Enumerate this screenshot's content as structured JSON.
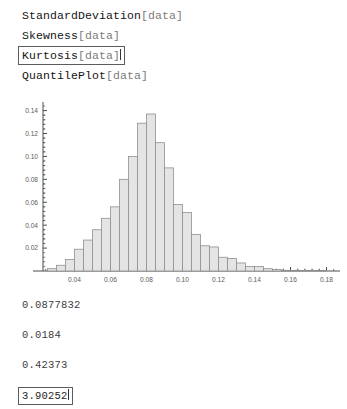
{
  "notebook": {
    "input_cells": [
      {
        "fn": "StandardDeviation",
        "arg": "[data]",
        "selected": false
      },
      {
        "fn": "Skewness",
        "arg": "[data]",
        "selected": false
      },
      {
        "fn": "Kurtosis",
        "arg": "[data]",
        "selected": true
      },
      {
        "fn": "QuantilePlot",
        "arg": "[data]",
        "selected": false
      }
    ],
    "output_cells": [
      {
        "value": "0.0877832",
        "selected": false
      },
      {
        "value": "0.0184",
        "selected": false
      },
      {
        "value": "0.42373",
        "selected": false
      },
      {
        "value": "3.90252",
        "selected": true
      }
    ]
  },
  "colors": {
    "bar_fill": "#e4e4e4",
    "bar_stroke": "#8f8f8f",
    "axis": "#4d4d4d",
    "tick_label": "#5a5a5a",
    "selection_border": "#5c5c5c",
    "arg_text": "#7b7b7b"
  },
  "chart_data": {
    "type": "bar",
    "title": "",
    "xlabel": "",
    "ylabel": "",
    "xlim": [
      0.0225,
      0.1875
    ],
    "ylim": [
      0,
      0.1475
    ],
    "grid": false,
    "legend": null,
    "bin_width": 0.005,
    "xticks": [
      0.04,
      0.06,
      0.08,
      0.1,
      0.12,
      0.14,
      0.16,
      0.18
    ],
    "xtick_labels": [
      "0.04",
      "0.06",
      "0.08",
      "0.10",
      "0.12",
      "0.14",
      "0.16",
      "0.18"
    ],
    "yticks": [
      0.02,
      0.04,
      0.06,
      0.08,
      0.1,
      0.12,
      0.14
    ],
    "ytick_labels": [
      "0.02",
      "0.04",
      "0.06",
      "0.08",
      "0.10",
      "0.12",
      "0.14"
    ],
    "minor_tick_count": 4,
    "categories": [
      "0.0250",
      "0.0300",
      "0.0350",
      "0.0400",
      "0.0450",
      "0.0500",
      "0.0550",
      "0.0600",
      "0.0650",
      "0.0700",
      "0.0750",
      "0.0800",
      "0.0850",
      "0.0900",
      "0.0950",
      "0.1000",
      "0.1050",
      "0.1100",
      "0.1150",
      "0.1200",
      "0.1250",
      "0.1300",
      "0.1350",
      "0.1400",
      "0.1450",
      "0.1500",
      "0.1550",
      "0.1600",
      "0.1650",
      "0.1700",
      "0.1750"
    ],
    "values": [
      0.002,
      0.005,
      0.01,
      0.019,
      0.027,
      0.036,
      0.046,
      0.056,
      0.08,
      0.1,
      0.129,
      0.137,
      0.112,
      0.09,
      0.058,
      0.051,
      0.032,
      0.022,
      0.021,
      0.012,
      0.011,
      0.007,
      0.004,
      0.004,
      0.002,
      0.0012,
      0.0006,
      0.0006,
      0.0004,
      0.0004,
      0.0004
    ]
  }
}
